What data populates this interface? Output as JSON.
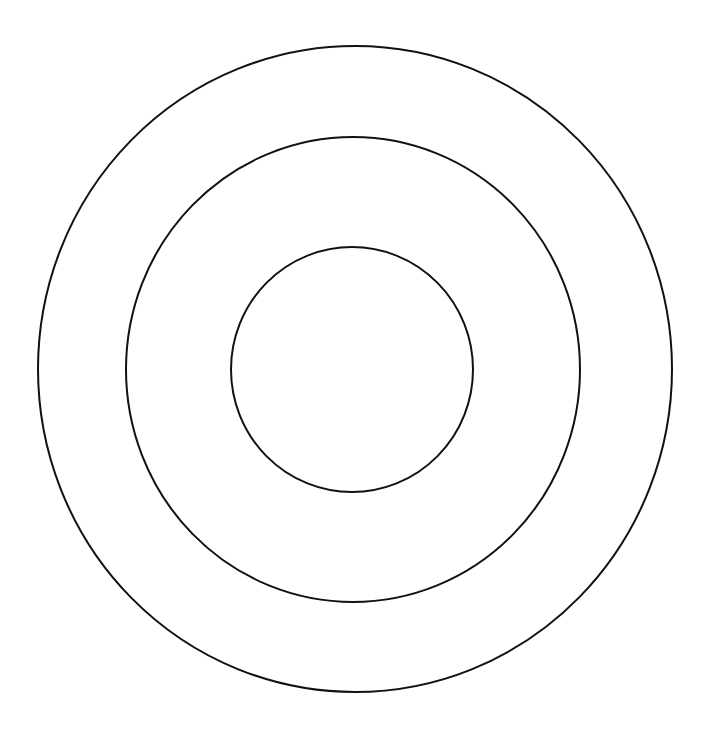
{
  "diagram": {
    "type": "concentric-circles",
    "background": "#ffffff",
    "stroke_color": "#111111",
    "stroke_width": 2,
    "rings": [
      {
        "name": "outer-ring",
        "cx": 355,
        "cy": 369,
        "rx": 317,
        "ry": 323
      },
      {
        "name": "middle-ring",
        "cx": 353,
        "cy": 369.5,
        "rx": 227,
        "ry": 232.5
      },
      {
        "name": "inner-ring",
        "cx": 352,
        "cy": 369.5,
        "rx": 121,
        "ry": 122.5
      }
    ]
  }
}
